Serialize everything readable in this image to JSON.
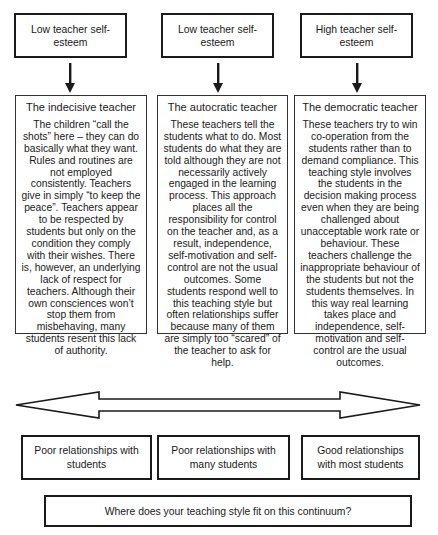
{
  "top_boxes": [
    {
      "label": "Low teacher self-esteem"
    },
    {
      "label": "Low teacher self-esteem"
    },
    {
      "label": "High teacher self-esteem"
    }
  ],
  "styles": [
    {
      "title": "The indecisive teacher",
      "body": "The children “call the shots” here – they can do basically what they want.  Rules and routines are not employed consistently.  Teachers give in simply “to keep the peace”.  Teachers appear to be respected by students but only on the condition they comply with their wishes.  There is, however, an underlying lack of respect for teachers.  Although their own consciences won’t stop them from misbehaving, many students resent this lack of authority."
    },
    {
      "title": "The autocratic teacher",
      "body": "These teachers tell the students what to do. Most students do what they are told although they are not necessarily actively engaged in the learning process.  This approach places all the responsibility for control on the teacher and, as a result, independence, self-motivation and self-control are not the usual outcomes.  Some students respond well to this teaching style but often relationships suffer because many of them are simply too “scared” of the teacher to ask for help."
    },
    {
      "title": "The democratic teacher",
      "body": "These teachers try to win co-operation from the students rather than to demand compliance.  This teaching style involves the students in the decision making process even when they are being challenged about unacceptable work rate or behaviour.  These teachers challenge the inappropriate behaviour of the students but not the students themselves.  In this way real learning takes place and independence, self-motivation and self-control are the usual outcomes."
    }
  ],
  "continuum": {
    "arrow": "double-headed arrow"
  },
  "relationships": [
    {
      "label": "Poor relationships with students"
    },
    {
      "label": "Poor relationships with many students"
    },
    {
      "label": "Good relationships with most students"
    }
  ],
  "question": "Where does your teaching style fit on this continuum?",
  "colors": {
    "stroke": "#1a1a1a",
    "background": "#ffffff"
  }
}
